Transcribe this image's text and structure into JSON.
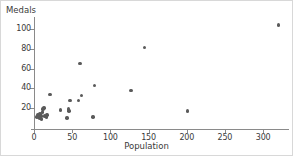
{
  "chart_data": {
    "type": "scatter",
    "title": "",
    "xlabel": "Population",
    "ylabel": "Medals",
    "xlim": [
      0,
      330
    ],
    "ylim": [
      0,
      110
    ],
    "xticks": [
      0,
      50,
      100,
      150,
      200,
      250,
      300
    ],
    "yticks": [
      20,
      40,
      60,
      80,
      100
    ],
    "grid": false,
    "legend": null,
    "marker_color": "#5a5a5a",
    "axis_color": "#8a8a8a",
    "points": [
      {
        "x": 4,
        "y": 11
      },
      {
        "x": 5,
        "y": 13
      },
      {
        "x": 7,
        "y": 10
      },
      {
        "x": 8,
        "y": 14
      },
      {
        "x": 9,
        "y": 12
      },
      {
        "x": 10,
        "y": 9
      },
      {
        "x": 11,
        "y": 16
      },
      {
        "x": 12,
        "y": 19
      },
      {
        "x": 13,
        "y": 20
      },
      {
        "x": 14,
        "y": 12
      },
      {
        "x": 16,
        "y": 11
      },
      {
        "x": 17,
        "y": 13
      },
      {
        "x": 21,
        "y": 34
      },
      {
        "x": 35,
        "y": 18
      },
      {
        "x": 43,
        "y": 10
      },
      {
        "x": 45,
        "y": 19
      },
      {
        "x": 46,
        "y": 17
      },
      {
        "x": 47,
        "y": 28
      },
      {
        "x": 58,
        "y": 28
      },
      {
        "x": 60,
        "y": 65
      },
      {
        "x": 62,
        "y": 33
      },
      {
        "x": 77,
        "y": 11
      },
      {
        "x": 79,
        "y": 43
      },
      {
        "x": 127,
        "y": 38
      },
      {
        "x": 145,
        "y": 81
      },
      {
        "x": 201,
        "y": 17
      },
      {
        "x": 320,
        "y": 104
      }
    ]
  }
}
